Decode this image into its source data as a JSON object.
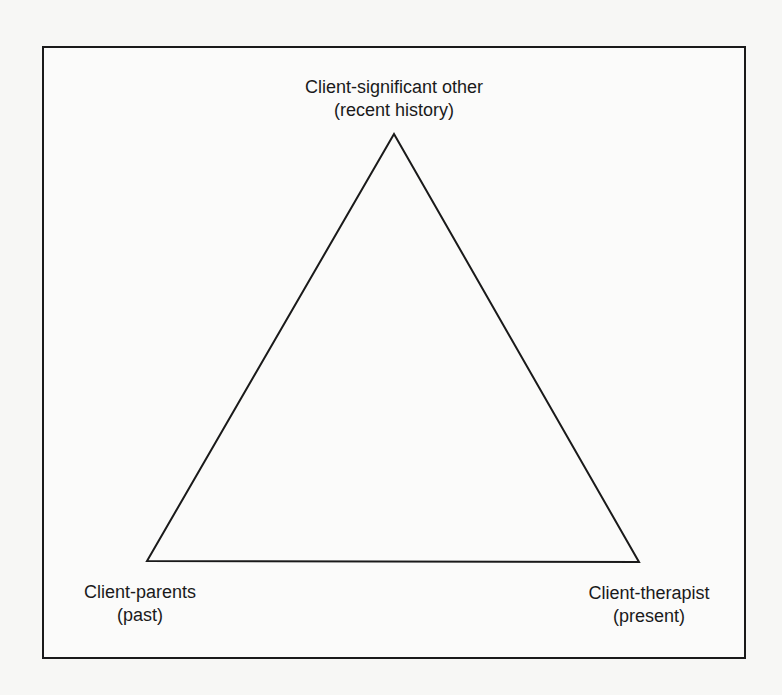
{
  "diagram": {
    "type": "triangle",
    "frame": {
      "border_color": "#1a1a1a"
    },
    "vertices": [
      {
        "id": "top",
        "title": "Client-significant other",
        "subtitle": "(recent history)"
      },
      {
        "id": "left",
        "title": "Client-parents",
        "subtitle": "(past)"
      },
      {
        "id": "right",
        "title": "Client-therapist",
        "subtitle": "(present)"
      }
    ],
    "edges": [
      {
        "from": "top",
        "to": "left"
      },
      {
        "from": "left",
        "to": "right"
      },
      {
        "from": "right",
        "to": "top"
      }
    ],
    "stroke_color": "#1a1a1a"
  }
}
